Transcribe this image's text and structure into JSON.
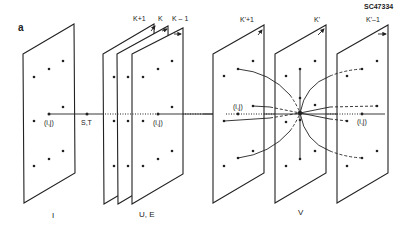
{
  "figure": {
    "panel_letter": "a",
    "figure_id": "SC47334"
  },
  "groups": [
    {
      "name": "I",
      "label": "I"
    },
    {
      "name": "U,E",
      "label": "U, E"
    },
    {
      "name": "V",
      "label": "V"
    }
  ],
  "plane_labels": {
    "k_plus_1": "K+1",
    "k": "K",
    "k_minus_1": "K – 1",
    "kp_plus_1": "K'+1",
    "kp": "K'",
    "kp_minus_1": "K'–1"
  },
  "point_labels": {
    "ij_I": "(i,j)",
    "st": "S,T",
    "ij_UE": "(i,j)",
    "ij_V_left": "(i,j)",
    "ij_V_right": "(i,j)"
  }
}
